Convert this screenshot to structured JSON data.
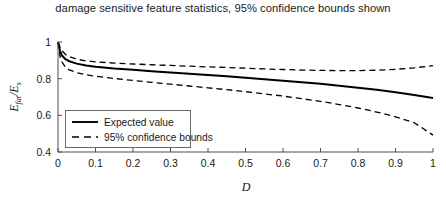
{
  "chart_data": {
    "type": "line",
    "title": "damage sensitive feature statistics, 95% confidence bounds shown",
    "xlabel": "D",
    "ylabel": "E_fat/E_s",
    "ylabel_parts": {
      "num_base": "E",
      "num_sub": "fat",
      "slash": "/",
      "den_base": "E",
      "den_sub": "s"
    },
    "xlim": [
      0,
      1
    ],
    "ylim": [
      0.4,
      1.0
    ],
    "xticks": [
      0,
      0.1,
      0.2,
      0.3,
      0.4,
      0.5,
      0.6,
      0.7,
      0.8,
      0.9,
      1
    ],
    "xticklabels": [
      "0",
      "0.1",
      "0.2",
      "0.3",
      "0.4",
      "0.5",
      "0.6",
      "0.7",
      "0.8",
      "0.9",
      "1"
    ],
    "yticks": [
      0.4,
      0.6,
      0.8,
      1.0
    ],
    "yticklabels": [
      "0.4",
      "0.6",
      "0.8",
      "1"
    ],
    "grid": false,
    "legend_position": "lower left",
    "series": [
      {
        "name": "Expected value",
        "style": "solid",
        "color": "#000000",
        "x": [
          0,
          0.005,
          0.01,
          0.02,
          0.03,
          0.05,
          0.075,
          0.1,
          0.15,
          0.2,
          0.25,
          0.3,
          0.35,
          0.4,
          0.45,
          0.5,
          0.55,
          0.6,
          0.65,
          0.7,
          0.75,
          0.8,
          0.85,
          0.9,
          0.95,
          1.0
        ],
        "y": [
          1.0,
          0.955,
          0.928,
          0.906,
          0.895,
          0.882,
          0.872,
          0.865,
          0.855,
          0.848,
          0.841,
          0.834,
          0.827,
          0.82,
          0.813,
          0.805,
          0.797,
          0.789,
          0.781,
          0.772,
          0.762,
          0.751,
          0.739,
          0.726,
          0.711,
          0.695
        ]
      },
      {
        "name": "95% confidence bounds upper",
        "style": "dashed",
        "color": "#000000",
        "x": [
          0,
          0.005,
          0.01,
          0.02,
          0.03,
          0.05,
          0.075,
          0.1,
          0.15,
          0.2,
          0.25,
          0.3,
          0.35,
          0.4,
          0.45,
          0.5,
          0.55,
          0.6,
          0.65,
          0.7,
          0.75,
          0.8,
          0.85,
          0.9,
          0.95,
          1.0
        ],
        "y": [
          1.0,
          0.975,
          0.955,
          0.932,
          0.92,
          0.906,
          0.897,
          0.892,
          0.885,
          0.88,
          0.876,
          0.872,
          0.868,
          0.864,
          0.861,
          0.857,
          0.853,
          0.85,
          0.847,
          0.845,
          0.844,
          0.844,
          0.846,
          0.851,
          0.859,
          0.871
        ]
      },
      {
        "name": "95% confidence bounds lower",
        "style": "dashed",
        "color": "#000000",
        "x": [
          0,
          0.005,
          0.01,
          0.02,
          0.03,
          0.05,
          0.075,
          0.1,
          0.15,
          0.2,
          0.25,
          0.3,
          0.35,
          0.4,
          0.45,
          0.5,
          0.55,
          0.6,
          0.65,
          0.7,
          0.75,
          0.8,
          0.85,
          0.9,
          0.95,
          1.0
        ],
        "y": [
          1.0,
          0.925,
          0.893,
          0.862,
          0.848,
          0.833,
          0.821,
          0.813,
          0.801,
          0.79,
          0.78,
          0.77,
          0.76,
          0.75,
          0.74,
          0.729,
          0.717,
          0.705,
          0.691,
          0.676,
          0.659,
          0.64,
          0.618,
          0.592,
          0.56,
          0.492
        ]
      }
    ],
    "legend": [
      {
        "label": "Expected value",
        "style": "solid"
      },
      {
        "label": "95% confidence bounds",
        "style": "dashed"
      }
    ]
  }
}
